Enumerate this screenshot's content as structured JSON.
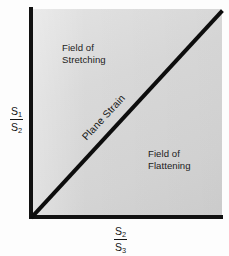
{
  "figure": {
    "type": "flinn-diagram",
    "title": "",
    "background_color": "#fdfdfd",
    "field_color": "#d9d9d9",
    "line_color": "#111111"
  },
  "axes": {
    "y": {
      "numerator": "S",
      "numerator_sub": "1",
      "denominator": "S",
      "denominator_sub": "2",
      "label_text": "S1/S2"
    },
    "x": {
      "numerator": "S",
      "numerator_sub": "2",
      "denominator": "S",
      "denominator_sub": "3",
      "label_text": "S2/S3"
    }
  },
  "annotations": {
    "upper_field": "Field of\nStretching",
    "lower_field": "Field of\nFlattening",
    "diagonal": "Plane Strain"
  },
  "chart_data": {
    "type": "line",
    "title": "",
    "xlabel": "S2/S3",
    "ylabel": "S1/S2",
    "xlim": [
      0,
      1
    ],
    "ylim": [
      0,
      1
    ],
    "grid": false,
    "legend": "none",
    "series": [
      {
        "name": "Plane Strain",
        "x": [
          0,
          1
        ],
        "y": [
          0,
          1
        ]
      }
    ],
    "regions": [
      {
        "name": "Field of Stretching",
        "position": "above-diagonal"
      },
      {
        "name": "Field of Flattening",
        "position": "below-diagonal"
      }
    ]
  }
}
